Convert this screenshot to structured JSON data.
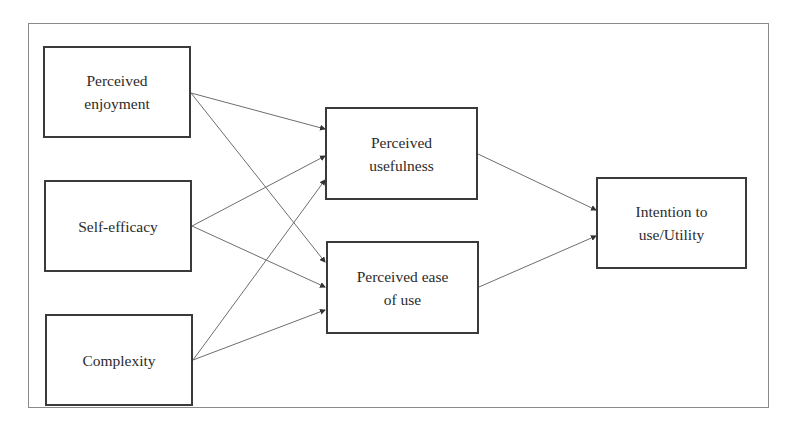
{
  "diagram": {
    "type": "path-model",
    "nodes": [
      {
        "id": "enjoyment",
        "label": "Perceived\nenjoyment",
        "x": 43,
        "y": 46,
        "w": 148,
        "h": 92
      },
      {
        "id": "selfefficacy",
        "label": "Self-efficacy",
        "x": 44,
        "y": 180,
        "w": 148,
        "h": 92
      },
      {
        "id": "complexity",
        "label": "Complexity",
        "x": 45,
        "y": 314,
        "w": 148,
        "h": 92
      },
      {
        "id": "usefulness",
        "label": "Perceived\nusefulness",
        "x": 325,
        "y": 107,
        "w": 153,
        "h": 93
      },
      {
        "id": "easeofuse",
        "label": "Perceived ease\nof use",
        "x": 326,
        "y": 241,
        "w": 153,
        "h": 93
      },
      {
        "id": "intention",
        "label": "Intention to\nuse/Utility",
        "x": 596,
        "y": 177,
        "w": 151,
        "h": 92
      }
    ],
    "edges": [
      {
        "from": "enjoyment",
        "to": "usefulness",
        "x1": 191,
        "y1": 93,
        "x2": 325,
        "y2": 129
      },
      {
        "from": "enjoyment",
        "to": "easeofuse",
        "x1": 191,
        "y1": 93,
        "x2": 325,
        "y2": 262
      },
      {
        "from": "selfefficacy",
        "to": "usefulness",
        "x1": 192,
        "y1": 226,
        "x2": 325,
        "y2": 156
      },
      {
        "from": "selfefficacy",
        "to": "easeofuse",
        "x1": 192,
        "y1": 226,
        "x2": 325,
        "y2": 287
      },
      {
        "from": "complexity",
        "to": "usefulness",
        "x1": 193,
        "y1": 360,
        "x2": 325,
        "y2": 180
      },
      {
        "from": "complexity",
        "to": "easeofuse",
        "x1": 193,
        "y1": 360,
        "x2": 325,
        "y2": 310
      },
      {
        "from": "usefulness",
        "to": "intention",
        "x1": 478,
        "y1": 154,
        "x2": 596,
        "y2": 210
      },
      {
        "from": "easeofuse",
        "to": "intention",
        "x1": 479,
        "y1": 287,
        "x2": 596,
        "y2": 236
      }
    ],
    "colors": {
      "edge": "#6e6e6e",
      "border": "#3a3a3a",
      "text": "#2b2b2b"
    }
  }
}
